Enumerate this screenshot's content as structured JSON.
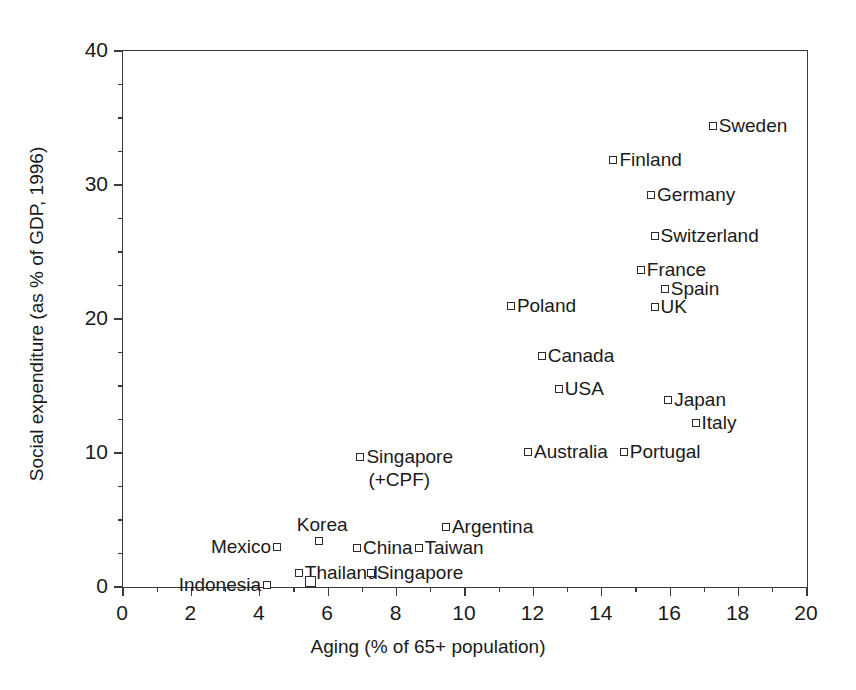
{
  "chart_data": {
    "type": "scatter",
    "title": "",
    "xlabel": "Aging (% of 65+ population)",
    "ylabel": "Social expenditure (as % of GDP, 1996)",
    "xlim": [
      0,
      20
    ],
    "ylim": [
      0,
      40
    ],
    "xticks": [
      0,
      2,
      4,
      6,
      8,
      10,
      12,
      14,
      16,
      18,
      20
    ],
    "xtick_labels": [
      "0",
      "2",
      "4",
      "6",
      "8",
      "10",
      "12",
      "14",
      "16",
      "18",
      "20"
    ],
    "yticks": [
      0,
      10,
      20,
      30,
      40
    ],
    "ytick_labels": [
      "0",
      "10",
      "20",
      "30",
      "40"
    ],
    "y_minor_ticks": [
      2.5,
      5,
      7.5,
      12.5,
      15,
      17.5,
      22.5,
      25,
      27.5,
      32.5,
      35,
      37.5
    ],
    "x_minor_ticks": [
      1,
      3,
      5,
      7,
      9,
      11,
      13,
      15,
      17,
      19
    ],
    "grid": false,
    "legend": "none",
    "marker_style": "open-square",
    "marker_color": "#2b2b2b",
    "axis_color": "#3a3a3a",
    "points": [
      {
        "label": "Sweden",
        "x": 17.3,
        "y": 34.3,
        "label_side": "right"
      },
      {
        "label": "Finland",
        "x": 14.4,
        "y": 31.8,
        "label_side": "right"
      },
      {
        "label": "Germany",
        "x": 15.5,
        "y": 29.2,
        "label_side": "right"
      },
      {
        "label": "Switzerland",
        "x": 15.6,
        "y": 26.1,
        "label_side": "right"
      },
      {
        "label": "France",
        "x": 15.2,
        "y": 23.6,
        "label_side": "right"
      },
      {
        "label": "Spain",
        "x": 15.9,
        "y": 22.2,
        "label_side": "right"
      },
      {
        "label": "UK",
        "x": 15.6,
        "y": 20.8,
        "label_side": "right"
      },
      {
        "label": "Poland",
        "x": 11.4,
        "y": 20.9,
        "label_side": "right"
      },
      {
        "label": "Canada",
        "x": 12.3,
        "y": 17.2,
        "label_side": "right"
      },
      {
        "label": "USA",
        "x": 12.8,
        "y": 14.7,
        "label_side": "right"
      },
      {
        "label": "Japan",
        "x": 16.0,
        "y": 13.9,
        "label_side": "right"
      },
      {
        "label": "Italy",
        "x": 16.8,
        "y": 12.2,
        "label_side": "right"
      },
      {
        "label": "Australia",
        "x": 11.9,
        "y": 10.0,
        "label_side": "right"
      },
      {
        "label": "Portugal",
        "x": 14.7,
        "y": 10.0,
        "label_side": "right"
      },
      {
        "label": "Singapore",
        "x": 7.0,
        "y": 9.6,
        "label_side": "right",
        "sublabel": "(+CPF)"
      },
      {
        "label": "Argentina",
        "x": 9.5,
        "y": 4.4,
        "label_side": "right"
      },
      {
        "label": "Korea",
        "x": 5.8,
        "y": 2.9,
        "label_side": "above"
      },
      {
        "label": "Mexico",
        "x": 4.5,
        "y": 2.9,
        "label_side": "left"
      },
      {
        "label": "China",
        "x": 6.9,
        "y": 2.8,
        "label_side": "right"
      },
      {
        "label": "Taiwan",
        "x": 8.7,
        "y": 2.8,
        "label_side": "right"
      },
      {
        "label": "Thailand",
        "x": 5.2,
        "y": 1.0,
        "label_side": "right"
      },
      {
        "label": "Singapore",
        "x": 7.3,
        "y": 1.0,
        "label_side": "right"
      },
      {
        "label": "Indonesia",
        "x": 4.2,
        "y": 0.05,
        "label_side": "left",
        "marker_size": "small"
      },
      {
        "label": "",
        "x": 5.5,
        "y": 0.0,
        "label_side": "right",
        "marker_size": "big"
      }
    ]
  }
}
